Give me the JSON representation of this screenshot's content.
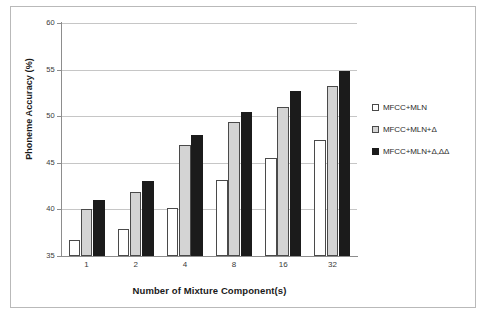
{
  "chart_data": {
    "type": "bar",
    "title": "",
    "xlabel": "Number of Mixture Component(s)",
    "ylabel": "Phoneme Accuracy (%)",
    "categories": [
      "1",
      "2",
      "4",
      "8",
      "16",
      "32"
    ],
    "series": [
      {
        "name": "MFCC+MLN",
        "values": [
          36.7,
          37.9,
          40.1,
          43.2,
          45.5,
          47.5
        ],
        "color": "#ffffff"
      },
      {
        "name": "MFCC+MLN+Δ",
        "values": [
          40.0,
          41.9,
          46.9,
          49.4,
          51.0,
          53.2
        ],
        "color": "#d4d4d4"
      },
      {
        "name": "MFCC+MLN+Δ,ΔΔ",
        "values": [
          41.0,
          43.1,
          48.0,
          50.4,
          52.7,
          54.9
        ],
        "color": "#1b1b1b"
      }
    ],
    "ylim": [
      35,
      60
    ],
    "yticks": [
      "35",
      "40",
      "45",
      "50",
      "55",
      "60"
    ],
    "ytick_values": [
      35,
      40,
      45,
      50,
      55,
      60
    ],
    "grid": true,
    "legend_position": "right"
  }
}
